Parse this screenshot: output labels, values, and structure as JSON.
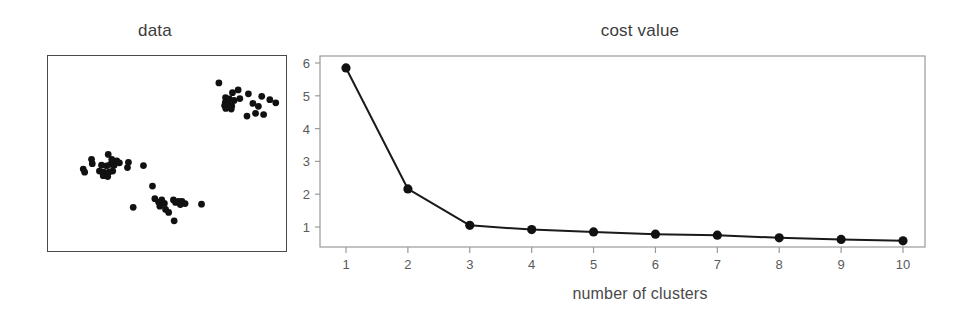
{
  "figure": {
    "background": "#ffffff",
    "ink_color": "#1a1a1a",
    "axis_color": "#808080",
    "text_color": "#3c3c3c"
  },
  "panels": {
    "scatter": {
      "title": "data",
      "frame_color": "#4a4a4a",
      "point_color": "#111111"
    },
    "cost": {
      "title": "cost value",
      "xlabel": "number of clusters",
      "ylabel": ""
    }
  },
  "chart_data": [
    {
      "type": "scatter",
      "title": "data",
      "xlabel": "",
      "ylabel": "",
      "grid": false,
      "legend": false,
      "axis_ticks_shown": false,
      "xlim": [
        0,
        1
      ],
      "ylim": [
        0,
        1
      ],
      "marker_color": "#111111",
      "marker_size": 3.4,
      "n_points": 60,
      "clusters_visible": 2,
      "series": [
        {
          "name": "cluster-upper-right",
          "points": [
            [
              0.718,
              0.862
            ],
            [
              0.775,
              0.812
            ],
            [
              0.799,
              0.826
            ],
            [
              0.842,
              0.806
            ],
            [
              0.746,
              0.787
            ],
            [
              0.762,
              0.78
            ],
            [
              0.782,
              0.772
            ],
            [
              0.806,
              0.782
            ],
            [
              0.745,
              0.762
            ],
            [
              0.757,
              0.757
            ],
            [
              0.898,
              0.793
            ],
            [
              0.932,
              0.776
            ],
            [
              0.742,
              0.746
            ],
            [
              0.772,
              0.744
            ],
            [
              0.861,
              0.757
            ],
            [
              0.884,
              0.742
            ],
            [
              0.747,
              0.731
            ],
            [
              0.77,
              0.728
            ],
            [
              0.957,
              0.76
            ],
            [
              0.872,
              0.706
            ],
            [
              0.906,
              0.7
            ],
            [
              0.836,
              0.692
            ]
          ]
        },
        {
          "name": "cluster-lower-left-upper-lobe",
          "points": [
            [
              0.183,
              0.47
            ],
            [
              0.186,
              0.448
            ],
            [
              0.253,
              0.495
            ],
            [
              0.268,
              0.47
            ],
            [
              0.289,
              0.462
            ],
            [
              0.3,
              0.452
            ],
            [
              0.225,
              0.44
            ],
            [
              0.246,
              0.437
            ],
            [
              0.262,
              0.444
            ],
            [
              0.278,
              0.44
            ],
            [
              0.338,
              0.455
            ],
            [
              0.148,
              0.42
            ],
            [
              0.154,
              0.404
            ],
            [
              0.216,
              0.41
            ],
            [
              0.234,
              0.404
            ],
            [
              0.244,
              0.398
            ],
            [
              0.258,
              0.406
            ],
            [
              0.272,
              0.41
            ],
            [
              0.232,
              0.386
            ],
            [
              0.251,
              0.382
            ],
            [
              0.334,
              0.428
            ],
            [
              0.401,
              0.438
            ]
          ]
        },
        {
          "name": "cluster-lower-left-lower-lobe",
          "points": [
            [
              0.439,
              0.333
            ],
            [
              0.449,
              0.268
            ],
            [
              0.465,
              0.25
            ],
            [
              0.47,
              0.23
            ],
            [
              0.478,
              0.262
            ],
            [
              0.489,
              0.244
            ],
            [
              0.494,
              0.213
            ],
            [
              0.507,
              0.198
            ],
            [
              0.527,
              0.262
            ],
            [
              0.536,
              0.249
            ],
            [
              0.548,
              0.255
            ],
            [
              0.556,
              0.238
            ],
            [
              0.563,
              0.254
            ],
            [
              0.576,
              0.243
            ],
            [
              0.645,
              0.24
            ],
            [
              0.358,
              0.224
            ],
            [
              0.53,
              0.155
            ]
          ]
        }
      ]
    },
    {
      "type": "line",
      "title": "cost value",
      "xlabel": "number of clusters",
      "ylabel": "",
      "grid": false,
      "legend": false,
      "marker": "circle",
      "marker_color": "#111111",
      "line_color": "#1a1a1a",
      "xlim": [
        0.5,
        10.6
      ],
      "ylim": [
        0.38,
        6.1
      ],
      "xticks": [
        1,
        2,
        3,
        4,
        5,
        6,
        7,
        8,
        9,
        10
      ],
      "xticklabels": [
        "1",
        "2",
        "3",
        "4",
        "5",
        "6",
        "7",
        "8",
        "9",
        "10"
      ],
      "yticks": [
        1,
        2,
        3,
        4,
        5,
        6
      ],
      "yticklabels": [
        "1",
        "2",
        "3",
        "4",
        "5",
        "6"
      ],
      "x": [
        1,
        2,
        3,
        4,
        5,
        6,
        7,
        8,
        9,
        10
      ],
      "values": [
        5.85,
        2.16,
        1.05,
        0.92,
        0.85,
        0.78,
        0.75,
        0.67,
        0.62,
        0.58
      ],
      "categories": [
        "1",
        "2",
        "3",
        "4",
        "5",
        "6",
        "7",
        "8",
        "9",
        "10"
      ],
      "series": [
        {
          "name": "cost value",
          "values": [
            5.85,
            2.16,
            1.05,
            0.92,
            0.85,
            0.78,
            0.75,
            0.67,
            0.62,
            0.58
          ]
        }
      ]
    }
  ]
}
